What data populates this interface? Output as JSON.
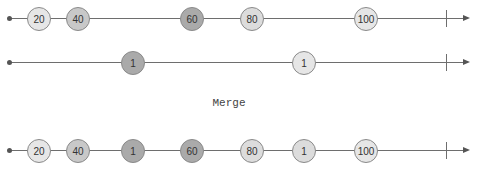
{
  "diagram": {
    "type": "marble-diagram",
    "operator_label": "Merge",
    "colors": {
      "line": "#6e6e6e",
      "marble_border": "#8a8a8a",
      "light": "#e6e6e6",
      "pale": "#dcdcdc",
      "medium": "#c8c8c8",
      "dark": "#aaaaaa"
    },
    "streams": [
      {
        "name": "source-a",
        "marbles": [
          {
            "value": "20",
            "x": 39,
            "shade": "light"
          },
          {
            "value": "40",
            "x": 78,
            "shade": "medium"
          },
          {
            "value": "60",
            "x": 192,
            "shade": "dark"
          },
          {
            "value": "80",
            "x": 252,
            "shade": "pale"
          },
          {
            "value": "100",
            "x": 366,
            "shade": "light"
          }
        ],
        "completed": true
      },
      {
        "name": "source-b",
        "marbles": [
          {
            "value": "1",
            "x": 133,
            "shade": "dark"
          },
          {
            "value": "1",
            "x": 304,
            "shade": "light"
          }
        ],
        "completed": true
      },
      {
        "name": "merged-output",
        "marbles": [
          {
            "value": "20",
            "x": 39,
            "shade": "light"
          },
          {
            "value": "40",
            "x": 78,
            "shade": "medium"
          },
          {
            "value": "1",
            "x": 133,
            "shade": "dark"
          },
          {
            "value": "60",
            "x": 192,
            "shade": "dark"
          },
          {
            "value": "80",
            "x": 252,
            "shade": "pale"
          },
          {
            "value": "1",
            "x": 304,
            "shade": "pale"
          },
          {
            "value": "100",
            "x": 366,
            "shade": "light"
          }
        ],
        "completed": true
      }
    ]
  }
}
